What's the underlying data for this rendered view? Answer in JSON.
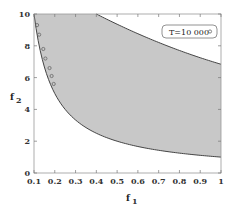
{
  "chart_data": {
    "type": "area",
    "title": "",
    "xlabel": "f1",
    "ylabel": "f2",
    "xlim": [
      0.1,
      1
    ],
    "ylim": [
      0,
      10
    ],
    "xticks": [
      "0.1",
      "0.2",
      "0.3",
      "0.4",
      "0.5",
      "0.6",
      "0.7",
      "0.8",
      "0.9",
      "1"
    ],
    "yticks": [
      "0",
      "2",
      "4",
      "6",
      "8",
      "10"
    ],
    "grid": false,
    "legend": {
      "position": "upper-right",
      "entries": [
        "T=10 000"
      ]
    },
    "series": [
      {
        "name": "lower boundary",
        "x": [
          0.1,
          0.2,
          0.3,
          0.4,
          0.5,
          0.6,
          0.7,
          0.8,
          0.9,
          1.0
        ],
        "y": [
          10,
          5,
          3.33,
          2.5,
          2,
          1.67,
          1.43,
          1.25,
          1.11,
          1
        ]
      },
      {
        "name": "upper boundary",
        "x": [
          0.4,
          0.5,
          0.6,
          0.7,
          0.8,
          0.9,
          1.0
        ],
        "y": [
          10,
          9.0,
          8.2,
          7.5,
          6.9,
          6.4,
          6.0
        ]
      },
      {
        "name": "T=10 000",
        "marker": "circle",
        "x": [
          0.11,
          0.12,
          0.14,
          0.15,
          0.17,
          0.18,
          0.19
        ],
        "y": [
          9.3,
          8.7,
          7.8,
          7.2,
          6.6,
          6.1,
          5.6
        ]
      }
    ],
    "fill_color": "#c8c8c8"
  },
  "legend_label": "T=10 000",
  "xlabel": "f",
  "xlabel_sub": "1",
  "ylabel": "f",
  "ylabel_sub": "2"
}
